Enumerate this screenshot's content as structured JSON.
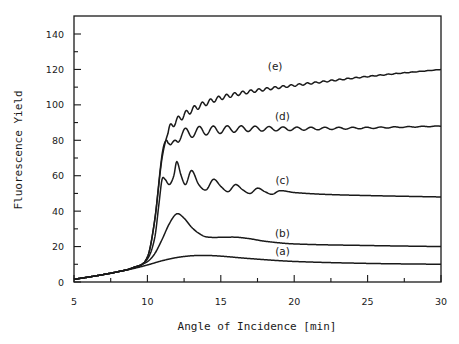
{
  "chart_data": {
    "type": "line",
    "title": "",
    "xlabel": "Angle of Incidence [min]",
    "ylabel": "Fluorescence Yield",
    "xlim": [
      5,
      30
    ],
    "ylim": [
      0,
      150
    ],
    "xticks": [
      5,
      10,
      15,
      20,
      25,
      30
    ],
    "yticks": [
      0,
      20,
      40,
      60,
      80,
      100,
      120,
      140
    ],
    "x_minor_step": 2.5,
    "y_minor_step": 10,
    "grid": false,
    "legend": "inline curve labels",
    "series": [
      {
        "name": "(a)",
        "x": [
          5,
          6,
          7,
          8,
          9,
          10,
          11,
          12,
          13,
          14,
          15,
          17,
          20,
          25,
          30
        ],
        "y": [
          1.5,
          2.8,
          4.2,
          5.8,
          7.5,
          9.6,
          12.0,
          13.8,
          14.8,
          15.0,
          14.6,
          13.2,
          11.6,
          10.5,
          10.0
        ]
      },
      {
        "name": "(b)",
        "x": [
          5,
          6,
          7,
          8,
          9,
          10,
          10.5,
          11,
          11.5,
          12,
          12.5,
          13,
          13.5,
          14,
          15,
          16,
          17,
          18,
          20,
          25,
          30
        ],
        "y": [
          1.5,
          2.8,
          4.2,
          5.8,
          8.0,
          11.5,
          16,
          24,
          33,
          38.5,
          36,
          31,
          27.5,
          25.5,
          25.2,
          25.3,
          24.4,
          23.0,
          21.5,
          20.6,
          20.0
        ]
      },
      {
        "name": "(c)",
        "x": [
          5,
          6,
          7,
          8,
          9,
          10,
          10.5,
          10.8,
          11.0,
          11.2,
          11.5,
          11.8,
          12.0,
          12.3,
          12.6,
          13.0,
          13.5,
          14.0,
          14.5,
          15.0,
          15.5,
          16.0,
          16.5,
          17.0,
          17.5,
          18.0,
          18.5,
          19.0,
          20,
          22,
          25,
          30
        ],
        "y": [
          1.5,
          2.8,
          4.2,
          5.8,
          8.0,
          13,
          25,
          45,
          58,
          58,
          55,
          60,
          68,
          60,
          55,
          63,
          55,
          52,
          58,
          54,
          51,
          55,
          52,
          50,
          53,
          51,
          49.5,
          51.5,
          50.5,
          49.5,
          48.8,
          48.0
        ]
      },
      {
        "name": "(d)",
        "x": [
          5,
          6,
          7,
          8,
          9,
          10,
          10.5,
          11.0,
          11.3,
          11.6,
          12.0,
          15,
          20,
          25,
          30
        ],
        "y": [
          1.5,
          2.8,
          4.2,
          5.8,
          8.0,
          14,
          35,
          72,
          80,
          74,
          82,
          86,
          86.5,
          87,
          88
        ],
        "oscillation": {
          "period_deg": 0.95,
          "amplitude_start": 3.5,
          "decay_to": 0.3
        }
      },
      {
        "name": "(e)",
        "x": [
          5,
          6,
          7,
          8,
          9,
          10,
          10.5,
          11.0,
          11.5,
          12,
          13,
          14,
          15,
          17,
          20,
          25,
          30
        ],
        "y": [
          1.5,
          2.8,
          4.2,
          5.8,
          8.0,
          14,
          35,
          70,
          86,
          91,
          97,
          101,
          104,
          107.5,
          111,
          116,
          120
        ],
        "oscillation": {
          "period_deg": 0.55,
          "amplitude_start": 1.8,
          "decay_to": 0.3
        }
      }
    ],
    "annotations": [
      {
        "text": "(a)",
        "x": 19.2,
        "y": 15.5
      },
      {
        "text": "(b)",
        "x": 19.2,
        "y": 25.5
      },
      {
        "text": "(c)",
        "x": 19.2,
        "y": 55.5
      },
      {
        "text": "(d)",
        "x": 19.2,
        "y": 91.5
      },
      {
        "text": "(e)",
        "x": 18.7,
        "y": 119.5
      }
    ]
  }
}
